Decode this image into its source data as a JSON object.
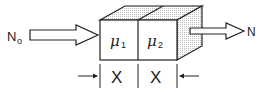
{
  "diagram": {
    "input_label": "N",
    "input_subscript": "o",
    "output_label": "N",
    "slabs": [
      {
        "symbol": "μ",
        "subscript": "1",
        "thickness_label": "X"
      },
      {
        "symbol": "μ",
        "subscript": "2",
        "thickness_label": "X"
      }
    ],
    "colors": {
      "stroke": "#222222",
      "shade": "#cfcfcf",
      "background": "#ffffff"
    }
  }
}
